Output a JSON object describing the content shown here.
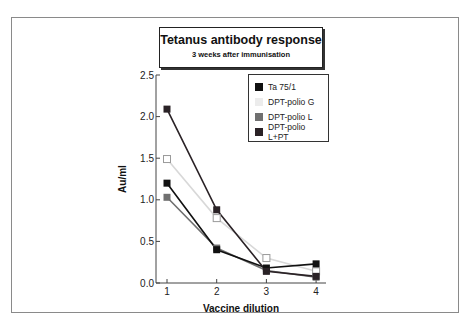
{
  "chart_data": {
    "type": "line",
    "title": "Tetanus antibody response",
    "subtitle": "3 weeks after immunisation",
    "xlabel": "Vaccine dilution",
    "ylabel": "Au/ml",
    "x": [
      1,
      2,
      3,
      4
    ],
    "x_tick_labels": [
      "1",
      "2",
      "3",
      "4"
    ],
    "y_tick_labels": [
      "0.0",
      "0.5",
      "1.0",
      "1.5",
      "2.0",
      "2.5"
    ],
    "ylim": [
      0,
      2.5
    ],
    "grid": false,
    "legend_position": "upper right",
    "series": [
      {
        "name": "Ta 75/1",
        "color": "#111111",
        "marker": "filled-square",
        "values": [
          1.2,
          0.4,
          0.18,
          0.23
        ]
      },
      {
        "name": "DPT-polio G",
        "color": "#d8d8d8",
        "marker": "open-square",
        "values": [
          1.49,
          0.78,
          0.3,
          0.14
        ]
      },
      {
        "name": "DPT-polio L",
        "color": "#707070",
        "marker": "filled-square",
        "values": [
          1.03,
          0.42,
          0.15,
          0.07
        ]
      },
      {
        "name": "DPT-polio L+PT",
        "color": "#2a2226",
        "marker": "filled-square",
        "values": [
          2.09,
          0.88,
          0.14,
          0.08
        ]
      }
    ]
  }
}
